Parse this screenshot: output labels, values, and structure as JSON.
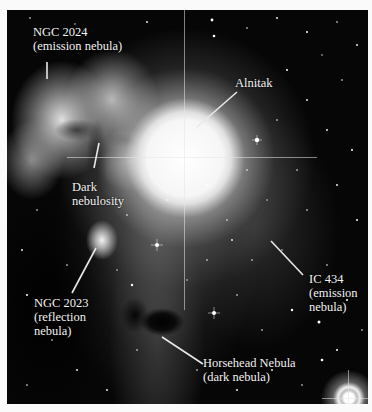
{
  "image": {
    "subject": "Horsehead Nebula region in Orion",
    "style": "black-and-white astronomical photograph with white border"
  },
  "labels": {
    "ngc2024": {
      "line1": "NGC 2024",
      "line2": "(emission nebula)"
    },
    "alnitak": {
      "line1": "Alnitak"
    },
    "dark_nebulosity": {
      "line1": "Dark",
      "line2": "nebulosity"
    },
    "ic434": {
      "line1": "IC 434",
      "line2": "(emission",
      "line3": "nebula)"
    },
    "ngc2023": {
      "line1": "NGC 2023",
      "line2": "(reflection",
      "line3": "nebula)"
    },
    "horsehead": {
      "line1": "Horsehead Nebula",
      "line2": "(dark nebula)"
    }
  },
  "colors": {
    "border": "#fafafa",
    "sky": "#060606",
    "label_text": "#f2f2f2",
    "leader_line": "#e8e8e8"
  }
}
